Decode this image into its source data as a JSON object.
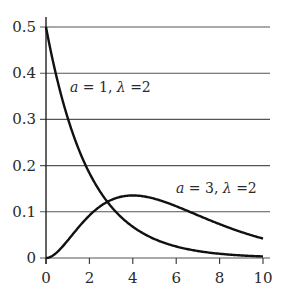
{
  "chart_data": {
    "type": "line",
    "title": "",
    "xlabel": "",
    "ylabel": "",
    "xlim": [
      0,
      10
    ],
    "ylim": [
      0,
      0.5
    ],
    "grid": "horizontal",
    "x_ticks": [
      "0",
      "2",
      "4",
      "6",
      "8",
      "10"
    ],
    "y_ticks": [
      "0",
      "0.1",
      "0.2",
      "0.3",
      "0.4",
      "0.5"
    ],
    "series": [
      {
        "name": "a = 1, λ = 2",
        "formula": "gamma pdf, shape 1, scale 2",
        "x": [
          0,
          1,
          2,
          3,
          4,
          5,
          6,
          7,
          8,
          9,
          10
        ],
        "values": [
          0.5,
          0.303,
          0.184,
          0.112,
          0.068,
          0.041,
          0.025,
          0.015,
          0.009,
          0.006,
          0.003
        ]
      },
      {
        "name": "a = 3, λ = 2",
        "formula": "gamma pdf, shape 3, scale 2",
        "x": [
          0,
          1,
          2,
          3,
          4,
          5,
          6,
          7,
          8,
          9,
          10
        ],
        "values": [
          0,
          0.038,
          0.092,
          0.126,
          0.135,
          0.128,
          0.112,
          0.092,
          0.073,
          0.056,
          0.042
        ]
      }
    ],
    "annotations": [
      {
        "text_parts": [
          "a",
          " = 1,  ",
          "λ",
          " =2"
        ],
        "near_series": 0
      },
      {
        "text_parts": [
          "a",
          " = 3,  ",
          "λ",
          " =2"
        ],
        "near_series": 1
      }
    ]
  }
}
